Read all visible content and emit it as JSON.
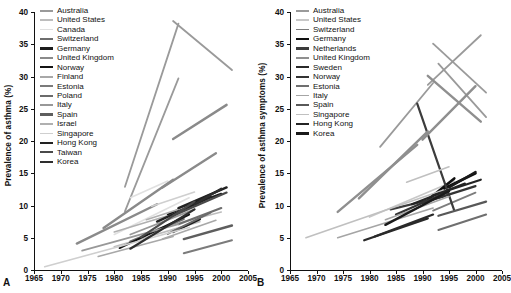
{
  "figure": {
    "panels": [
      {
        "letter": "A",
        "ylabel": "Prevalence of asthma (%)",
        "legend": [
          {
            "label": "Australia",
            "color": "#9a9a9a",
            "width": 1.8
          },
          {
            "label": "United States",
            "color": "#bdbdbd",
            "width": 1.6
          },
          {
            "label": "Canada",
            "color": "#e0e0e0",
            "width": 1.6
          },
          {
            "label": "Switzerland",
            "color": "#6e6e6e",
            "width": 2.2
          },
          {
            "label": "Germany",
            "color": "#1c1c1c",
            "width": 2.4
          },
          {
            "label": "United Kingdom",
            "color": "#8a8a8a",
            "width": 2.4
          },
          {
            "label": "Norway",
            "color": "#141414",
            "width": 2.0
          },
          {
            "label": "Finland",
            "color": "#a8a8a8",
            "width": 1.6
          },
          {
            "label": "Estonia",
            "color": "#7b7b7b",
            "width": 2.0
          },
          {
            "label": "Poland",
            "color": "#6b6b6b",
            "width": 2.0
          },
          {
            "label": "Italy",
            "color": "#989898",
            "width": 1.8
          },
          {
            "label": "Spain",
            "color": "#5e5e5e",
            "width": 2.4
          },
          {
            "label": "Israel",
            "color": "#b0b0b0",
            "width": 1.6
          },
          {
            "label": "Singapore",
            "color": "#cfcfcf",
            "width": 1.6
          },
          {
            "label": "Hong Kong",
            "color": "#222222",
            "width": 2.4
          },
          {
            "label": "Taiwan",
            "color": "#4a4a4a",
            "width": 2.2
          },
          {
            "label": "Korea",
            "color": "#2e2e2e",
            "width": 2.2
          }
        ]
      },
      {
        "letter": "B",
        "ylabel": "Prevalence of asthma symptoms (%)",
        "legend": [
          {
            "label": "Australia",
            "color": "#9a9a9a",
            "width": 1.8
          },
          {
            "label": "United States",
            "color": "#c8c8c8",
            "width": 1.6
          },
          {
            "label": "Switzerland",
            "color": "#7d7d7d",
            "width": 1.8
          },
          {
            "label": "Germany",
            "color": "#101010",
            "width": 2.6
          },
          {
            "label": "Netherlands",
            "color": "#3c3c3c",
            "width": 2.2
          },
          {
            "label": "United Kingdom",
            "color": "#8f8f8f",
            "width": 2.4
          },
          {
            "label": "Sweden",
            "color": "#2a2a2a",
            "width": 2.2
          },
          {
            "label": "Norway",
            "color": "#333333",
            "width": 2.2
          },
          {
            "label": "Estonia",
            "color": "#6f6f6f",
            "width": 2.0
          },
          {
            "label": "Italy",
            "color": "#a5a5a5",
            "width": 1.6
          },
          {
            "label": "Spain",
            "color": "#585858",
            "width": 2.2
          },
          {
            "label": "Singapore",
            "color": "#c0c0c0",
            "width": 1.6
          },
          {
            "label": "Hong Kong",
            "color": "#242424",
            "width": 2.2
          },
          {
            "label": "Korea",
            "color": "#1a1a1a",
            "width": 2.4
          }
        ]
      }
    ]
  },
  "chart_data": [
    {
      "type": "line",
      "panel": "A",
      "title": "",
      "xlabel": "",
      "ylabel": "Prevalence of asthma (%)",
      "xlim": [
        1965,
        2005
      ],
      "ylim": [
        0,
        40
      ],
      "xticks": [
        1965,
        1970,
        1975,
        1980,
        1985,
        1990,
        1995,
        2000,
        2005
      ],
      "yticks": [
        0,
        5,
        10,
        15,
        20,
        25,
        30,
        35,
        40
      ],
      "grid": false,
      "legend_position": "upper-left-inside",
      "note": "Each series is a straight trend segment joining a first and a repeat survey",
      "series": [
        {
          "name": "Australia",
          "color": "#9a9a9a",
          "x": [
            1982,
            1992
          ],
          "y": [
            12.9,
            38.2
          ]
        },
        {
          "name": "Australia",
          "color": "#9a9a9a",
          "x": [
            1991,
            2002
          ],
          "y": [
            38.6,
            31.0
          ]
        },
        {
          "name": "Australia",
          "color": "#9a9a9a",
          "x": [
            1982,
            1992
          ],
          "y": [
            9.1,
            29.7
          ]
        },
        {
          "name": "United States",
          "color": "#bdbdbd",
          "x": [
            1980,
            1996
          ],
          "y": [
            3.6,
            7.5
          ]
        },
        {
          "name": "United States",
          "color": "#bdbdbd",
          "x": [
            1988,
            2000
          ],
          "y": [
            6.4,
            9.0
          ]
        },
        {
          "name": "Canada",
          "color": "#e0e0e0",
          "x": [
            1983,
            1990
          ],
          "y": [
            11.2,
            13.8
          ]
        },
        {
          "name": "Canada",
          "color": "#e0e0e0",
          "x": [
            1980,
            1994
          ],
          "y": [
            5.5,
            11.2
          ]
        },
        {
          "name": "Switzerland",
          "color": "#6e6e6e",
          "x": [
            1983,
            1993
          ],
          "y": [
            4.4,
            7.9
          ]
        },
        {
          "name": "Switzerland",
          "color": "#6e6e6e",
          "x": [
            1992,
            2000
          ],
          "y": [
            7.1,
            9.6
          ]
        },
        {
          "name": "Germany",
          "color": "#1c1c1c",
          "x": [
            1991,
            1996
          ],
          "y": [
            5.9,
            7.9
          ]
        },
        {
          "name": "Germany",
          "color": "#1c1c1c",
          "x": [
            1992,
            2000
          ],
          "y": [
            9.4,
            11.8
          ]
        },
        {
          "name": "United Kingdom",
          "color": "#8a8a8a",
          "x": [
            1973,
            1988
          ],
          "y": [
            4.1,
            10.2
          ]
        },
        {
          "name": "United Kingdom",
          "color": "#8a8a8a",
          "x": [
            1978,
            1991
          ],
          "y": [
            6.5,
            14.0
          ]
        },
        {
          "name": "United Kingdom",
          "color": "#8a8a8a",
          "x": [
            1989,
            1999
          ],
          "y": [
            12.8,
            18.1
          ]
        },
        {
          "name": "United Kingdom",
          "color": "#8a8a8a",
          "x": [
            1991,
            2001
          ],
          "y": [
            20.3,
            25.6
          ]
        },
        {
          "name": "Norway",
          "color": "#141414",
          "x": [
            1981,
            1994
          ],
          "y": [
            3.4,
            8.6
          ]
        },
        {
          "name": "Norway",
          "color": "#141414",
          "x": [
            1990,
            2000
          ],
          "y": [
            8.6,
            12.5
          ]
        },
        {
          "name": "Finland",
          "color": "#a8a8a8",
          "x": [
            1977,
            1991
          ],
          "y": [
            2.1,
            5.2
          ]
        },
        {
          "name": "Finland",
          "color": "#a8a8a8",
          "x": [
            1989,
            1999
          ],
          "y": [
            4.8,
            7.7
          ]
        },
        {
          "name": "Estonia",
          "color": "#7b7b7b",
          "x": [
            1993,
            2002
          ],
          "y": [
            2.6,
            4.6
          ]
        },
        {
          "name": "Poland",
          "color": "#6b6b6b",
          "x": [
            1990,
            1998
          ],
          "y": [
            5.6,
            8.9
          ]
        },
        {
          "name": "Italy",
          "color": "#989898",
          "x": [
            1974,
            1992
          ],
          "y": [
            3.0,
            7.1
          ]
        },
        {
          "name": "Italy",
          "color": "#989898",
          "x": [
            1983,
            1995
          ],
          "y": [
            5.5,
            9.4
          ]
        },
        {
          "name": "Spain",
          "color": "#5e5e5e",
          "x": [
            1993,
            2002
          ],
          "y": [
            4.8,
            6.9
          ]
        },
        {
          "name": "Israel",
          "color": "#b0b0b0",
          "x": [
            1980,
            1990
          ],
          "y": [
            5.9,
            8.4
          ]
        },
        {
          "name": "Israel",
          "color": "#b0b0b0",
          "x": [
            1986,
            1998
          ],
          "y": [
            7.8,
            11.0
          ]
        },
        {
          "name": "Singapore",
          "color": "#cfcfcf",
          "x": [
            1967,
            1994
          ],
          "y": [
            0.5,
            6.6
          ]
        },
        {
          "name": "Singapore",
          "color": "#cfcfcf",
          "x": [
            1987,
            1995
          ],
          "y": [
            9.9,
            12.1
          ]
        },
        {
          "name": "Hong Kong",
          "color": "#222222",
          "x": [
            1988,
            1998
          ],
          "y": [
            7.5,
            11.3
          ]
        },
        {
          "name": "Hong Kong",
          "color": "#222222",
          "x": [
            1992,
            2001
          ],
          "y": [
            9.6,
            12.8
          ]
        },
        {
          "name": "Taiwan",
          "color": "#4a4a4a",
          "x": [
            1985,
            1995
          ],
          "y": [
            5.1,
            10.6
          ]
        },
        {
          "name": "Taiwan",
          "color": "#4a4a4a",
          "x": [
            1991,
            2001
          ],
          "y": [
            8.4,
            12.0
          ]
        },
        {
          "name": "Korea",
          "color": "#2e2e2e",
          "x": [
            1983,
            1995
          ],
          "y": [
            3.3,
            9.4
          ]
        },
        {
          "name": "Korea",
          "color": "#2e2e2e",
          "x": [
            1995,
            2000
          ],
          "y": [
            10.2,
            12.6
          ]
        }
      ]
    },
    {
      "type": "line",
      "panel": "B",
      "title": "",
      "xlabel": "",
      "ylabel": "Prevalence of asthma symptoms (%)",
      "xlim": [
        1965,
        2005
      ],
      "ylim": [
        0,
        40
      ],
      "xticks": [
        1965,
        1970,
        1975,
        1980,
        1985,
        1990,
        1995,
        2000,
        2005
      ],
      "yticks": [
        0,
        5,
        10,
        15,
        20,
        25,
        30,
        35,
        40
      ],
      "grid": false,
      "legend_position": "upper-left-inside",
      "note": "Each series is a straight trend segment joining a first and a repeat survey",
      "series": [
        {
          "name": "Australia",
          "color": "#9a9a9a",
          "x": [
            1982,
            1992
          ],
          "y": [
            19.1,
            29.0
          ]
        },
        {
          "name": "Australia",
          "color": "#9a9a9a",
          "x": [
            1991,
            2001
          ],
          "y": [
            28.7,
            36.4
          ]
        },
        {
          "name": "Australia",
          "color": "#9a9a9a",
          "x": [
            1992,
            2002
          ],
          "y": [
            35.1,
            27.5
          ]
        },
        {
          "name": "Australia",
          "color": "#9a9a9a",
          "x": [
            1993,
            2002
          ],
          "y": [
            32.0,
            23.7
          ]
        },
        {
          "name": "United States",
          "color": "#c8c8c8",
          "x": [
            1980,
            1996
          ],
          "y": [
            8.2,
            13.8
          ]
        },
        {
          "name": "Switzerland",
          "color": "#7d7d7d",
          "x": [
            1992,
            2000
          ],
          "y": [
            9.2,
            12.0
          ]
        },
        {
          "name": "Germany",
          "color": "#101010",
          "x": [
            1991,
            1996
          ],
          "y": [
            10.9,
            14.2
          ]
        },
        {
          "name": "Germany",
          "color": "#101010",
          "x": [
            1994,
            2000
          ],
          "y": [
            12.6,
            15.0
          ]
        },
        {
          "name": "Netherlands",
          "color": "#3c3c3c",
          "x": [
            1989,
            1996
          ],
          "y": [
            25.8,
            9.2
          ]
        },
        {
          "name": "Netherlands",
          "color": "#3c3c3c",
          "x": [
            1984,
            1994
          ],
          "y": [
            9.4,
            11.4
          ]
        },
        {
          "name": "United Kingdom",
          "color": "#8f8f8f",
          "x": [
            1974,
            1989
          ],
          "y": [
            9.0,
            19.4
          ]
        },
        {
          "name": "United Kingdom",
          "color": "#8f8f8f",
          "x": [
            1978,
            1991
          ],
          "y": [
            11.1,
            21.5
          ]
        },
        {
          "name": "United Kingdom",
          "color": "#8f8f8f",
          "x": [
            1990,
            2000
          ],
          "y": [
            20.2,
            28.5
          ]
        },
        {
          "name": "United Kingdom",
          "color": "#8f8f8f",
          "x": [
            1991,
            2001
          ],
          "y": [
            30.1,
            23.0
          ]
        },
        {
          "name": "Sweden",
          "color": "#2a2a2a",
          "x": [
            1979,
            1991
          ],
          "y": [
            4.6,
            8.0
          ]
        },
        {
          "name": "Sweden",
          "color": "#2a2a2a",
          "x": [
            1981,
            1992
          ],
          "y": [
            5.2,
            8.6
          ]
        },
        {
          "name": "Norway",
          "color": "#333333",
          "x": [
            1985,
            1995
          ],
          "y": [
            8.6,
            12.2
          ]
        },
        {
          "name": "Norway",
          "color": "#333333",
          "x": [
            1990,
            2000
          ],
          "y": [
            10.4,
            13.0
          ]
        },
        {
          "name": "Estonia",
          "color": "#6f6f6f",
          "x": [
            1993,
            2002
          ],
          "y": [
            6.2,
            8.6
          ]
        },
        {
          "name": "Italy",
          "color": "#a5a5a5",
          "x": [
            1974,
            1992
          ],
          "y": [
            5.0,
            9.6
          ]
        },
        {
          "name": "Italy",
          "color": "#a5a5a5",
          "x": [
            1983,
            1995
          ],
          "y": [
            7.8,
            11.4
          ]
        },
        {
          "name": "Spain",
          "color": "#585858",
          "x": [
            1993,
            2002
          ],
          "y": [
            8.4,
            10.6
          ]
        },
        {
          "name": "Singapore",
          "color": "#c0c0c0",
          "x": [
            1968,
            1994
          ],
          "y": [
            5.0,
            12.4
          ]
        },
        {
          "name": "Singapore",
          "color": "#c0c0c0",
          "x": [
            1987,
            1995
          ],
          "y": [
            13.6,
            16.0
          ]
        },
        {
          "name": "Hong Kong",
          "color": "#242424",
          "x": [
            1988,
            1998
          ],
          "y": [
            10.2,
            13.4
          ]
        },
        {
          "name": "Hong Kong",
          "color": "#242424",
          "x": [
            1992,
            2001
          ],
          "y": [
            11.6,
            14.0
          ]
        },
        {
          "name": "Korea",
          "color": "#1a1a1a",
          "x": [
            1983,
            1995
          ],
          "y": [
            7.0,
            12.2
          ]
        },
        {
          "name": "Korea",
          "color": "#1a1a1a",
          "x": [
            1995,
            2000
          ],
          "y": [
            12.8,
            15.2
          ]
        }
      ]
    }
  ]
}
